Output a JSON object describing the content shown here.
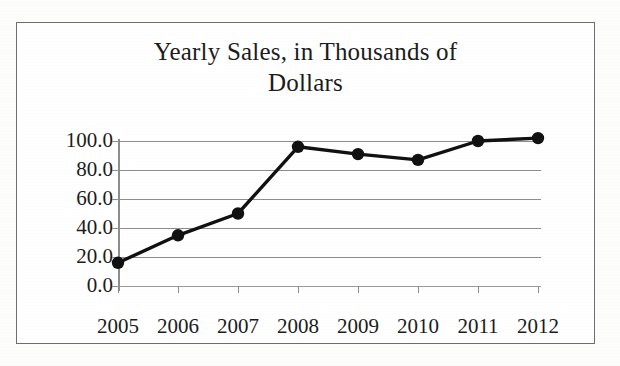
{
  "chart_data": {
    "type": "line",
    "title": "Yearly Sales, in Thousands of Dollars",
    "title_line1": "Yearly Sales, in Thousands of",
    "title_line2": "Dollars",
    "xlabel": "",
    "ylabel": "",
    "categories": [
      "2005",
      "2006",
      "2007",
      "2008",
      "2009",
      "2010",
      "2011",
      "2012"
    ],
    "values": [
      16,
      35,
      50,
      96,
      91,
      87,
      100,
      102
    ],
    "series": [
      {
        "name": "Yearly Sales",
        "values": [
          16,
          35,
          50,
          96,
          91,
          87,
          100,
          102
        ]
      }
    ],
    "ylim": [
      0,
      110
    ],
    "y_ticks": [
      0,
      20,
      40,
      60,
      80,
      100
    ],
    "y_tick_labels": [
      "0.0",
      "20.0",
      "40.0",
      "60.0",
      "80.0",
      "100.0"
    ],
    "grid": true,
    "grid_axis": "y",
    "legend": false,
    "legend_position": "none",
    "marker": "circle",
    "line_color": "#111111",
    "marker_color": "#111111",
    "grid_color": "#8d8d8d",
    "background_color": "#ffffff",
    "border_color": "#6e6e6e"
  }
}
